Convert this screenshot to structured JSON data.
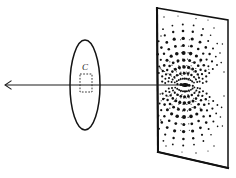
{
  "figure": {
    "background_color": "#ffffff",
    "ink_color": "#131313",
    "width": 236,
    "height": 178
  },
  "beam": {
    "name": "incident-beam-axis",
    "label": "",
    "start_x": 5,
    "start_y": 85,
    "end_x": 185,
    "end_y": 85,
    "arrow_at": "start",
    "stroke": "#1c1c1c"
  },
  "lens": {
    "name": "lens-ellipse",
    "label": "",
    "center_x": 85,
    "center_y": 85,
    "radius_x": 15,
    "radius_y": 45,
    "stroke": "#141414"
  },
  "sample": {
    "name": "sample-region",
    "label": "C",
    "x": 80,
    "y": 74,
    "width": 12,
    "height": 18,
    "label_x": 85,
    "label_y": 70,
    "stroke": "#2b2b2b",
    "dashed": true
  },
  "screen": {
    "name": "detection-screen",
    "label": "",
    "corners": [
      [
        157,
        8
      ],
      [
        228,
        20
      ],
      [
        228,
        168
      ],
      [
        158,
        152
      ]
    ],
    "stroke": "#111111",
    "fill": "#ffffff"
  },
  "pattern": {
    "name": "diffraction-pattern",
    "type": "dipole-lobes",
    "center_x": 185,
    "center_y": 85,
    "description": "Two mirror-symmetric lobes of discrete dots above and below the beam impact point, with radial streaks converging on the centre.",
    "center_blob": {
      "cx": 185,
      "cy": 85,
      "rx": 3.6,
      "ry": 1.9
    },
    "dots": [
      {
        "x": 185.0,
        "y": 85.0,
        "r": 1.9
      },
      {
        "x": 181.0,
        "y": 84.6,
        "r": 1.5
      },
      {
        "x": 189.2,
        "y": 85.4,
        "r": 1.4
      },
      {
        "x": 177.4,
        "y": 84.2,
        "r": 1.1
      },
      {
        "x": 192.8,
        "y": 85.8,
        "r": 1.1
      },
      {
        "x": 184.6,
        "y": 78.6,
        "r": 1.2
      },
      {
        "x": 186.4,
        "y": 78.8,
        "r": 1.0
      },
      {
        "x": 182.6,
        "y": 78.8,
        "r": 1.0
      },
      {
        "x": 188.4,
        "y": 79.4,
        "r": 1.1
      },
      {
        "x": 180.6,
        "y": 79.2,
        "r": 1.0
      },
      {
        "x": 190.4,
        "y": 80.2,
        "r": 0.9
      },
      {
        "x": 178.8,
        "y": 80.0,
        "r": 0.9
      },
      {
        "x": 176.8,
        "y": 81.2,
        "r": 1.0
      },
      {
        "x": 192.2,
        "y": 81.4,
        "r": 1.0
      },
      {
        "x": 174.8,
        "y": 82.4,
        "r": 0.9
      },
      {
        "x": 194.0,
        "y": 82.6,
        "r": 0.9
      },
      {
        "x": 184.2,
        "y": 73.2,
        "r": 1.5
      },
      {
        "x": 188.0,
        "y": 73.6,
        "r": 1.4
      },
      {
        "x": 180.4,
        "y": 73.8,
        "r": 1.3
      },
      {
        "x": 191.4,
        "y": 75.0,
        "r": 1.2
      },
      {
        "x": 177.0,
        "y": 75.2,
        "r": 1.2
      },
      {
        "x": 194.0,
        "y": 77.0,
        "r": 1.1
      },
      {
        "x": 174.4,
        "y": 77.2,
        "r": 1.1
      },
      {
        "x": 196.0,
        "y": 79.4,
        "r": 1.0
      },
      {
        "x": 172.6,
        "y": 79.6,
        "r": 1.0
      },
      {
        "x": 197.2,
        "y": 82.0,
        "r": 1.0
      },
      {
        "x": 171.6,
        "y": 82.0,
        "r": 1.0
      },
      {
        "x": 184.0,
        "y": 67.0,
        "r": 1.8
      },
      {
        "x": 188.6,
        "y": 67.4,
        "r": 1.6
      },
      {
        "x": 179.4,
        "y": 67.6,
        "r": 1.6
      },
      {
        "x": 192.6,
        "y": 69.0,
        "r": 1.5
      },
      {
        "x": 175.4,
        "y": 69.2,
        "r": 1.5
      },
      {
        "x": 195.6,
        "y": 71.4,
        "r": 1.3
      },
      {
        "x": 172.4,
        "y": 71.6,
        "r": 1.3
      },
      {
        "x": 197.8,
        "y": 74.4,
        "r": 1.2
      },
      {
        "x": 170.2,
        "y": 74.6,
        "r": 1.2
      },
      {
        "x": 199.0,
        "y": 77.8,
        "r": 1.1
      },
      {
        "x": 169.0,
        "y": 78.0,
        "r": 1.1
      },
      {
        "x": 199.6,
        "y": 81.4,
        "r": 1.0
      },
      {
        "x": 168.4,
        "y": 81.4,
        "r": 1.0
      },
      {
        "x": 183.8,
        "y": 60.2,
        "r": 1.6
      },
      {
        "x": 189.6,
        "y": 60.6,
        "r": 1.5
      },
      {
        "x": 178.0,
        "y": 60.8,
        "r": 1.5
      },
      {
        "x": 194.4,
        "y": 62.6,
        "r": 1.4
      },
      {
        "x": 173.2,
        "y": 62.8,
        "r": 1.4
      },
      {
        "x": 198.2,
        "y": 65.8,
        "r": 1.3
      },
      {
        "x": 169.6,
        "y": 66.0,
        "r": 1.3
      },
      {
        "x": 200.6,
        "y": 69.8,
        "r": 1.2
      },
      {
        "x": 167.2,
        "y": 70.0,
        "r": 1.2
      },
      {
        "x": 202.0,
        "y": 74.2,
        "r": 1.1
      },
      {
        "x": 166.0,
        "y": 74.4,
        "r": 1.1
      },
      {
        "x": 202.6,
        "y": 78.8,
        "r": 1.0
      },
      {
        "x": 165.4,
        "y": 78.8,
        "r": 1.0
      },
      {
        "x": 202.8,
        "y": 83.0,
        "r": 1.0
      },
      {
        "x": 165.2,
        "y": 83.0,
        "r": 1.0
      },
      {
        "x": 183.6,
        "y": 53.0,
        "r": 2.0
      },
      {
        "x": 190.6,
        "y": 53.6,
        "r": 1.8
      },
      {
        "x": 176.8,
        "y": 53.8,
        "r": 1.8
      },
      {
        "x": 196.4,
        "y": 56.0,
        "r": 1.6
      },
      {
        "x": 171.2,
        "y": 56.2,
        "r": 1.6
      },
      {
        "x": 200.8,
        "y": 60.0,
        "r": 1.5
      },
      {
        "x": 167.0,
        "y": 60.2,
        "r": 1.5
      },
      {
        "x": 203.8,
        "y": 65.2,
        "r": 1.3
      },
      {
        "x": 164.2,
        "y": 65.4,
        "r": 1.3
      },
      {
        "x": 205.4,
        "y": 70.8,
        "r": 1.2
      },
      {
        "x": 162.8,
        "y": 71.0,
        "r": 1.2
      },
      {
        "x": 206.2,
        "y": 76.4,
        "r": 1.1
      },
      {
        "x": 162.2,
        "y": 76.4,
        "r": 1.1
      },
      {
        "x": 206.4,
        "y": 81.6,
        "r": 1.1
      },
      {
        "x": 162.2,
        "y": 81.6,
        "r": 1.1
      },
      {
        "x": 183.4,
        "y": 45.6,
        "r": 1.5
      },
      {
        "x": 191.4,
        "y": 46.2,
        "r": 1.4
      },
      {
        "x": 175.4,
        "y": 46.4,
        "r": 1.4
      },
      {
        "x": 198.2,
        "y": 49.0,
        "r": 1.3
      },
      {
        "x": 168.8,
        "y": 49.2,
        "r": 1.3
      },
      {
        "x": 203.2,
        "y": 53.6,
        "r": 1.2
      },
      {
        "x": 164.0,
        "y": 53.8,
        "r": 1.2
      },
      {
        "x": 206.6,
        "y": 59.6,
        "r": 1.1
      },
      {
        "x": 160.8,
        "y": 59.8,
        "r": 1.1
      },
      {
        "x": 208.4,
        "y": 66.2,
        "r": 1.0
      },
      {
        "x": 159.2,
        "y": 66.4,
        "r": 1.0
      },
      {
        "x": 209.2,
        "y": 73.0,
        "r": 1.0
      },
      {
        "x": 158.8,
        "y": 73.0,
        "r": 1.0
      },
      {
        "x": 183.2,
        "y": 38.4,
        "r": 1.7
      },
      {
        "x": 192.2,
        "y": 39.0,
        "r": 1.6
      },
      {
        "x": 174.2,
        "y": 39.2,
        "r": 1.6
      },
      {
        "x": 200.0,
        "y": 42.2,
        "r": 1.4
      },
      {
        "x": 166.8,
        "y": 42.4,
        "r": 1.4
      },
      {
        "x": 205.8,
        "y": 47.4,
        "r": 1.3
      },
      {
        "x": 161.4,
        "y": 47.6,
        "r": 1.3
      },
      {
        "x": 209.6,
        "y": 54.0,
        "r": 1.2
      },
      {
        "x": 157.8,
        "y": 54.2,
        "r": 1.2
      },
      {
        "x": 212.0,
        "y": 61.4,
        "r": 1.1
      },
      {
        "x": 212.8,
        "y": 69.0,
        "r": 1.0
      },
      {
        "x": 183.0,
        "y": 31.0,
        "r": 1.3
      },
      {
        "x": 192.8,
        "y": 31.8,
        "r": 1.2
      },
      {
        "x": 173.2,
        "y": 32.0,
        "r": 1.2
      },
      {
        "x": 201.6,
        "y": 35.2,
        "r": 1.1
      },
      {
        "x": 164.8,
        "y": 35.4,
        "r": 1.1
      },
      {
        "x": 208.2,
        "y": 41.0,
        "r": 1.0
      },
      {
        "x": 158.6,
        "y": 41.2,
        "r": 1.0
      },
      {
        "x": 213.0,
        "y": 48.4,
        "r": 1.0
      },
      {
        "x": 215.8,
        "y": 56.6,
        "r": 0.9
      },
      {
        "x": 217.0,
        "y": 65.0,
        "r": 0.9
      },
      {
        "x": 182.8,
        "y": 24.6,
        "r": 1.0
      },
      {
        "x": 193.6,
        "y": 25.4,
        "r": 0.9
      },
      {
        "x": 172.4,
        "y": 25.6,
        "r": 0.9
      },
      {
        "x": 203.0,
        "y": 29.0,
        "r": 0.9
      },
      {
        "x": 163.0,
        "y": 29.2,
        "r": 0.9
      },
      {
        "x": 210.6,
        "y": 35.2,
        "r": 0.8
      },
      {
        "x": 217.2,
        "y": 43.6,
        "r": 0.8
      },
      {
        "x": 220.0,
        "y": 53.0,
        "r": 0.8
      },
      {
        "x": 221.2,
        "y": 62.6,
        "r": 0.8
      },
      {
        "x": 185.0,
        "y": 91.4,
        "r": 1.2
      },
      {
        "x": 186.8,
        "y": 91.2,
        "r": 1.0
      },
      {
        "x": 183.0,
        "y": 91.2,
        "r": 1.0
      },
      {
        "x": 188.8,
        "y": 90.6,
        "r": 1.1
      },
      {
        "x": 181.0,
        "y": 90.8,
        "r": 1.0
      },
      {
        "x": 190.8,
        "y": 89.8,
        "r": 0.9
      },
      {
        "x": 179.2,
        "y": 90.0,
        "r": 0.9
      },
      {
        "x": 177.2,
        "y": 88.8,
        "r": 1.0
      },
      {
        "x": 192.6,
        "y": 88.6,
        "r": 1.0
      },
      {
        "x": 175.2,
        "y": 87.6,
        "r": 0.9
      },
      {
        "x": 194.4,
        "y": 87.4,
        "r": 0.9
      },
      {
        "x": 184.6,
        "y": 96.8,
        "r": 1.5
      },
      {
        "x": 188.4,
        "y": 96.4,
        "r": 1.4
      },
      {
        "x": 180.8,
        "y": 96.2,
        "r": 1.3
      },
      {
        "x": 191.8,
        "y": 95.0,
        "r": 1.2
      },
      {
        "x": 177.4,
        "y": 94.8,
        "r": 1.2
      },
      {
        "x": 194.4,
        "y": 93.0,
        "r": 1.1
      },
      {
        "x": 174.8,
        "y": 92.8,
        "r": 1.1
      },
      {
        "x": 196.4,
        "y": 90.6,
        "r": 1.0
      },
      {
        "x": 173.0,
        "y": 90.4,
        "r": 1.0
      },
      {
        "x": 197.6,
        "y": 88.0,
        "r": 1.0
      },
      {
        "x": 172.0,
        "y": 88.0,
        "r": 1.0
      },
      {
        "x": 184.4,
        "y": 103.0,
        "r": 1.8
      },
      {
        "x": 189.0,
        "y": 102.6,
        "r": 1.6
      },
      {
        "x": 179.8,
        "y": 102.4,
        "r": 1.6
      },
      {
        "x": 193.0,
        "y": 101.0,
        "r": 1.5
      },
      {
        "x": 175.8,
        "y": 100.8,
        "r": 1.5
      },
      {
        "x": 196.0,
        "y": 98.6,
        "r": 1.3
      },
      {
        "x": 172.8,
        "y": 98.4,
        "r": 1.3
      },
      {
        "x": 198.2,
        "y": 95.6,
        "r": 1.2
      },
      {
        "x": 170.6,
        "y": 95.4,
        "r": 1.2
      },
      {
        "x": 199.4,
        "y": 92.2,
        "r": 1.1
      },
      {
        "x": 169.4,
        "y": 92.0,
        "r": 1.1
      },
      {
        "x": 200.0,
        "y": 88.6,
        "r": 1.0
      },
      {
        "x": 168.8,
        "y": 88.6,
        "r": 1.0
      },
      {
        "x": 184.2,
        "y": 109.8,
        "r": 1.6
      },
      {
        "x": 190.0,
        "y": 109.4,
        "r": 1.5
      },
      {
        "x": 178.4,
        "y": 109.2,
        "r": 1.5
      },
      {
        "x": 194.8,
        "y": 107.4,
        "r": 1.4
      },
      {
        "x": 173.6,
        "y": 107.2,
        "r": 1.4
      },
      {
        "x": 198.6,
        "y": 104.2,
        "r": 1.3
      },
      {
        "x": 170.0,
        "y": 104.0,
        "r": 1.3
      },
      {
        "x": 201.0,
        "y": 100.2,
        "r": 1.2
      },
      {
        "x": 167.6,
        "y": 100.0,
        "r": 1.2
      },
      {
        "x": 202.4,
        "y": 95.8,
        "r": 1.1
      },
      {
        "x": 166.4,
        "y": 95.6,
        "r": 1.1
      },
      {
        "x": 203.0,
        "y": 91.2,
        "r": 1.0
      },
      {
        "x": 165.8,
        "y": 91.2,
        "r": 1.0
      },
      {
        "x": 184.0,
        "y": 117.0,
        "r": 2.0
      },
      {
        "x": 191.0,
        "y": 116.4,
        "r": 1.8
      },
      {
        "x": 177.2,
        "y": 116.2,
        "r": 1.8
      },
      {
        "x": 196.8,
        "y": 114.0,
        "r": 1.6
      },
      {
        "x": 171.6,
        "y": 113.8,
        "r": 1.6
      },
      {
        "x": 201.2,
        "y": 110.0,
        "r": 1.5
      },
      {
        "x": 167.4,
        "y": 109.8,
        "r": 1.5
      },
      {
        "x": 204.2,
        "y": 104.8,
        "r": 1.3
      },
      {
        "x": 164.6,
        "y": 104.6,
        "r": 1.3
      },
      {
        "x": 205.8,
        "y": 99.2,
        "r": 1.2
      },
      {
        "x": 163.2,
        "y": 99.0,
        "r": 1.2
      },
      {
        "x": 206.6,
        "y": 93.6,
        "r": 1.1
      },
      {
        "x": 162.6,
        "y": 93.6,
        "r": 1.1
      },
      {
        "x": 183.8,
        "y": 124.4,
        "r": 1.5
      },
      {
        "x": 191.8,
        "y": 123.8,
        "r": 1.4
      },
      {
        "x": 175.8,
        "y": 123.6,
        "r": 1.4
      },
      {
        "x": 198.6,
        "y": 121.0,
        "r": 1.3
      },
      {
        "x": 169.2,
        "y": 120.8,
        "r": 1.3
      },
      {
        "x": 203.6,
        "y": 116.4,
        "r": 1.2
      },
      {
        "x": 164.4,
        "y": 116.2,
        "r": 1.2
      },
      {
        "x": 207.0,
        "y": 110.4,
        "r": 1.1
      },
      {
        "x": 161.2,
        "y": 110.2,
        "r": 1.1
      },
      {
        "x": 208.8,
        "y": 103.8,
        "r": 1.0
      },
      {
        "x": 159.6,
        "y": 103.6,
        "r": 1.0
      },
      {
        "x": 209.6,
        "y": 97.0,
        "r": 1.0
      },
      {
        "x": 183.6,
        "y": 131.6,
        "r": 1.7
      },
      {
        "x": 192.6,
        "y": 131.0,
        "r": 1.6
      },
      {
        "x": 174.6,
        "y": 130.8,
        "r": 1.6
      },
      {
        "x": 200.4,
        "y": 127.8,
        "r": 1.4
      },
      {
        "x": 167.2,
        "y": 127.6,
        "r": 1.4
      },
      {
        "x": 206.2,
        "y": 122.6,
        "r": 1.3
      },
      {
        "x": 161.8,
        "y": 122.4,
        "r": 1.3
      },
      {
        "x": 210.0,
        "y": 116.0,
        "r": 1.2
      },
      {
        "x": 158.2,
        "y": 115.8,
        "r": 1.2
      },
      {
        "x": 212.4,
        "y": 108.6,
        "r": 1.1
      },
      {
        "x": 213.2,
        "y": 101.0,
        "r": 1.0
      },
      {
        "x": 183.4,
        "y": 139.0,
        "r": 1.3
      },
      {
        "x": 193.2,
        "y": 138.2,
        "r": 1.2
      },
      {
        "x": 173.6,
        "y": 138.0,
        "r": 1.2
      },
      {
        "x": 202.0,
        "y": 134.8,
        "r": 1.1
      },
      {
        "x": 165.2,
        "y": 134.6,
        "r": 1.1
      },
      {
        "x": 208.6,
        "y": 129.0,
        "r": 1.0
      },
      {
        "x": 159.0,
        "y": 128.8,
        "r": 1.0
      },
      {
        "x": 213.4,
        "y": 121.6,
        "r": 1.0
      },
      {
        "x": 216.2,
        "y": 113.4,
        "r": 0.9
      },
      {
        "x": 217.4,
        "y": 105.0,
        "r": 0.9
      },
      {
        "x": 183.2,
        "y": 145.4,
        "r": 1.0
      },
      {
        "x": 194.0,
        "y": 144.6,
        "r": 0.9
      },
      {
        "x": 172.8,
        "y": 144.4,
        "r": 0.9
      },
      {
        "x": 203.4,
        "y": 141.0,
        "r": 0.9
      },
      {
        "x": 163.4,
        "y": 140.8,
        "r": 0.9
      },
      {
        "x": 211.0,
        "y": 134.8,
        "r": 0.8
      },
      {
        "x": 217.6,
        "y": 126.4,
        "r": 0.8
      },
      {
        "x": 220.4,
        "y": 117.0,
        "r": 0.8
      },
      {
        "x": 221.6,
        "y": 107.4,
        "r": 0.8
      },
      {
        "x": 164.0,
        "y": 17.0,
        "r": 0.7
      },
      {
        "x": 196.0,
        "y": 18.6,
        "r": 0.7
      },
      {
        "x": 214.0,
        "y": 28.0,
        "r": 0.7
      },
      {
        "x": 222.4,
        "y": 44.0,
        "r": 0.7
      },
      {
        "x": 224.0,
        "y": 72.0,
        "r": 0.7
      },
      {
        "x": 224.0,
        "y": 96.0,
        "r": 0.7
      },
      {
        "x": 222.4,
        "y": 126.0,
        "r": 0.7
      },
      {
        "x": 214.0,
        "y": 146.0,
        "r": 0.7
      },
      {
        "x": 196.0,
        "y": 153.0,
        "r": 0.7
      },
      {
        "x": 166.0,
        "y": 146.0,
        "r": 0.7
      },
      {
        "x": 160.8,
        "y": 120.0,
        "r": 0.7
      },
      {
        "x": 160.2,
        "y": 94.0,
        "r": 0.7
      },
      {
        "x": 160.2,
        "y": 68.0,
        "r": 0.7
      },
      {
        "x": 161.0,
        "y": 36.0,
        "r": 0.7
      },
      {
        "x": 178.0,
        "y": 16.0,
        "r": 0.6
      },
      {
        "x": 208.0,
        "y": 20.0,
        "r": 0.6
      },
      {
        "x": 182.0,
        "y": 152.0,
        "r": 0.6
      },
      {
        "x": 208.0,
        "y": 151.0,
        "r": 0.6
      }
    ]
  }
}
